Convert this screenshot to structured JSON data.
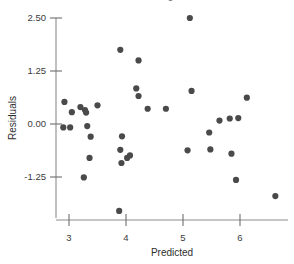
{
  "chart_data": {
    "type": "scatter",
    "title": "",
    "xlabel": "Predicted",
    "ylabel": "Residuals",
    "xlim": [
      2.55,
      6.85
    ],
    "ylim": [
      -2.35,
      3.15
    ],
    "grid": false,
    "legend": null,
    "xticks": [
      3,
      4,
      5,
      6
    ],
    "xtick_labels": [
      "3",
      "4",
      "5",
      "6"
    ],
    "yticks": [
      2.5,
      1.25,
      0.0,
      -1.25
    ],
    "ytick_labels": [
      "2.50",
      "1.25",
      "0.00",
      "-1.25"
    ],
    "marker": "filled-circle",
    "marker_color": "#4a4a4a",
    "marker_size_px": 4.4,
    "points": [
      {
        "x": 2.92,
        "y": 0.52
      },
      {
        "x": 2.9,
        "y": -0.08
      },
      {
        "x": 3.02,
        "y": -0.08
      },
      {
        "x": 3.05,
        "y": 0.28
      },
      {
        "x": 3.2,
        "y": 0.4
      },
      {
        "x": 3.28,
        "y": 0.33
      },
      {
        "x": 3.3,
        "y": 0.27
      },
      {
        "x": 3.32,
        "y": -0.05
      },
      {
        "x": 3.38,
        "y": -0.3
      },
      {
        "x": 3.36,
        "y": -0.8
      },
      {
        "x": 3.26,
        "y": -1.26
      },
      {
        "x": 3.5,
        "y": 0.44
      },
      {
        "x": 3.9,
        "y": 1.75
      },
      {
        "x": 3.93,
        "y": -0.29
      },
      {
        "x": 3.9,
        "y": -0.61
      },
      {
        "x": 3.92,
        "y": -0.92
      },
      {
        "x": 4.02,
        "y": -0.8
      },
      {
        "x": 4.07,
        "y": -0.74
      },
      {
        "x": 3.88,
        "y": -2.05
      },
      {
        "x": 4.22,
        "y": 1.5
      },
      {
        "x": 4.18,
        "y": 0.84
      },
      {
        "x": 4.22,
        "y": 0.66
      },
      {
        "x": 4.38,
        "y": 0.36
      },
      {
        "x": 4.7,
        "y": 0.36
      },
      {
        "x": 4.78,
        "y": 2.98
      },
      {
        "x": 5.12,
        "y": 2.5
      },
      {
        "x": 5.15,
        "y": 0.78
      },
      {
        "x": 5.08,
        "y": -0.62
      },
      {
        "x": 5.48,
        "y": -0.6
      },
      {
        "x": 5.46,
        "y": -0.2
      },
      {
        "x": 5.64,
        "y": 0.08
      },
      {
        "x": 5.82,
        "y": 0.13
      },
      {
        "x": 5.97,
        "y": 0.14
      },
      {
        "x": 5.85,
        "y": -0.7
      },
      {
        "x": 5.93,
        "y": -1.32
      },
      {
        "x": 6.12,
        "y": 0.62
      },
      {
        "x": 6.62,
        "y": -1.7
      }
    ]
  },
  "axes": {
    "x_axis_label": "Predicted",
    "y_axis_label": "Residuals"
  }
}
